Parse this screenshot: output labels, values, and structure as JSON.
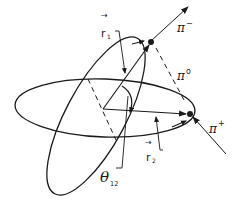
{
  "diagram": {
    "particles": {
      "pi_minus": {
        "symbol": "π",
        "charge": "−"
      },
      "pi_zero": {
        "symbol": "π",
        "charge": "o"
      },
      "pi_plus": {
        "symbol": "π",
        "charge": "+"
      }
    },
    "vectors": {
      "r1": {
        "symbol": "r",
        "subscript": "1"
      },
      "r2": {
        "symbol": "r",
        "subscript": "2"
      }
    },
    "angle": {
      "symbol": "θ",
      "subscript": "12"
    },
    "colors": {
      "stroke": "#1a1a1a",
      "background": "#ffffff"
    }
  }
}
